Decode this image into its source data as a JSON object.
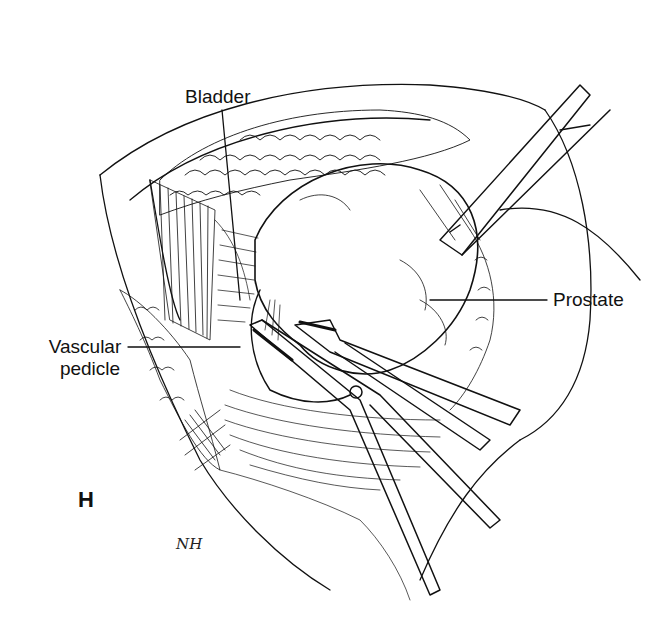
{
  "figure": {
    "panel_letter": "H",
    "artist_signature": "NH",
    "labels": [
      {
        "id": "bladder",
        "text": "Bladder"
      },
      {
        "id": "vascular_pedicle",
        "text": "Vascular\npedicle",
        "line1": "Vascular",
        "line2": "pedicle"
      },
      {
        "id": "prostate",
        "text": "Prostate"
      }
    ],
    "instruments": [
      {
        "name": "retractor-blade"
      },
      {
        "name": "right-angle-clamp"
      },
      {
        "name": "scissors"
      }
    ],
    "colors": {
      "ink": "#111111",
      "paper": "#ffffff"
    }
  }
}
